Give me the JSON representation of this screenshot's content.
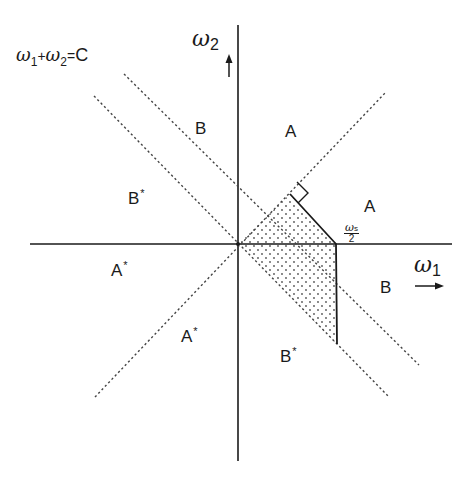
{
  "diagram": {
    "equation_label": {
      "lhs_1": "ω",
      "sub_1": "1",
      "plus": "+",
      "lhs_2": "ω",
      "sub_2": "2",
      "eq": "=",
      "rhs": "C"
    },
    "axes": {
      "x_label": {
        "symbol": "ω",
        "sub": "1"
      },
      "y_label": {
        "symbol": "ω",
        "sub": "2"
      },
      "arrow_x": "→",
      "arrow_y": "↑"
    },
    "cutoff_label": {
      "numerator_symbol": "ω",
      "numerator_sub": "s",
      "denominator": "2"
    },
    "regions": [
      {
        "id": "B_upper_left",
        "label": "B",
        "star": ""
      },
      {
        "id": "A_upper",
        "label": "A",
        "star": ""
      },
      {
        "id": "A_right",
        "label": "A",
        "star": ""
      },
      {
        "id": "B_right",
        "label": "B",
        "star": ""
      },
      {
        "id": "Bstar_left",
        "label": "B",
        "star": "*"
      },
      {
        "id": "Astar_left",
        "label": "A",
        "star": "*"
      },
      {
        "id": "Astar_lower",
        "label": "A",
        "star": "*"
      },
      {
        "id": "Bstar_lower",
        "label": "B",
        "star": "*"
      }
    ],
    "colors": {
      "ink": "#1a1a1a",
      "dash": "#444444",
      "dots": "#555555",
      "background": "#ffffff"
    }
  }
}
